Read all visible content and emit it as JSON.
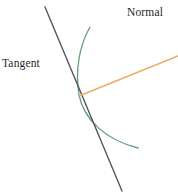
{
  "figure": {
    "title": "",
    "width": 178,
    "height": 194,
    "background_color": "#ffffff"
  },
  "labels": {
    "tangent": "Tangent",
    "normal": "Normal",
    "text_color": "#262626"
  },
  "colors": {
    "tangent_line": "#555566",
    "normal_line": "#f0a862",
    "curve": "#5e9e79"
  },
  "chart_data": {
    "type": "line",
    "title": "",
    "xlabel": "",
    "ylabel": "",
    "xlim": [
      0,
      178
    ],
    "ylim": [
      0,
      194
    ],
    "grid": false,
    "legend": "none",
    "annotations": [
      {
        "text": "Tangent",
        "x": 2,
        "y": 64,
        "anchor": "left"
      },
      {
        "text": "Normal",
        "x": 127,
        "y": 13,
        "anchor": "left"
      }
    ],
    "tangent_point": {
      "x": 79,
      "y": 95
    },
    "series": [
      {
        "name": "curve",
        "kind": "path",
        "color": "#5e9e79",
        "width": 1.3,
        "path": "M 90 27 C 79 46, 75 72, 79 95 C 84 120, 106 140, 138 148",
        "points": [
          {
            "x": 90,
            "y": 27
          },
          {
            "x": 80,
            "y": 48
          },
          {
            "x": 76,
            "y": 72
          },
          {
            "x": 79,
            "y": 95
          },
          {
            "x": 89,
            "y": 121
          },
          {
            "x": 110,
            "y": 139
          },
          {
            "x": 138,
            "y": 148
          }
        ]
      },
      {
        "name": "tangent-line",
        "kind": "segment",
        "color": "#555566",
        "width": 1.4,
        "x1": 45,
        "y1": 7,
        "x2": 122,
        "y2": 191
      },
      {
        "name": "normal-line",
        "kind": "segment",
        "color": "#f0a862",
        "width": 1.6,
        "x1": 79,
        "y1": 96,
        "x2": 178,
        "y2": 56
      }
    ]
  }
}
